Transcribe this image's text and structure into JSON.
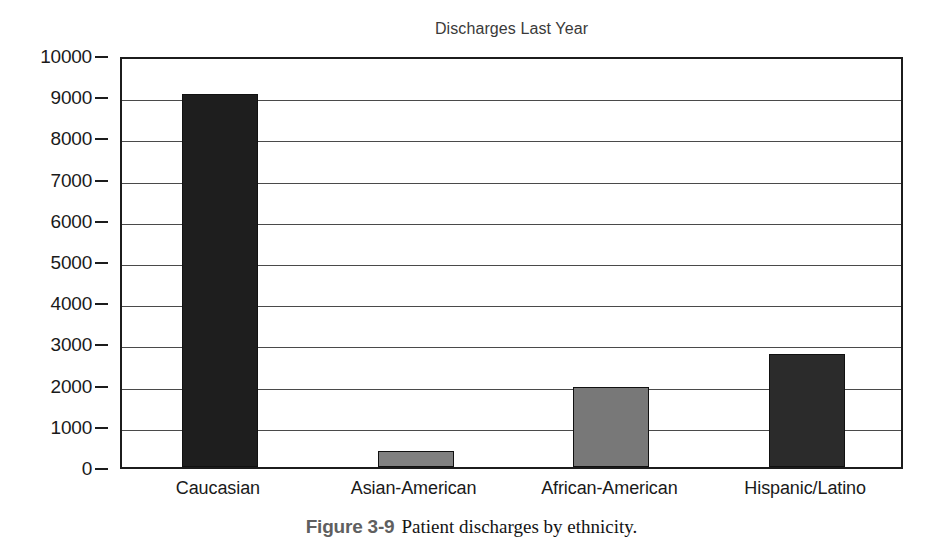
{
  "figure": {
    "caption_number": "Figure 3-9",
    "caption_text": "Patient discharges by ethnicity."
  },
  "chart_data": {
    "type": "bar",
    "title": "Discharges Last Year",
    "xlabel": "",
    "ylabel": "",
    "categories": [
      "Caucasian",
      "Asian-American",
      "African-American",
      "Hispanic/Latino"
    ],
    "values": [
      9050,
      380,
      1940,
      2740
    ],
    "bar_colors": [
      "#1e1e1e",
      "#808080",
      "#787878",
      "#2b2b2b"
    ],
    "ylim": [
      0,
      10000
    ],
    "ytick_labels": [
      "0",
      "1000",
      "2000",
      "3000",
      "4000",
      "5000",
      "6000",
      "7000",
      "8000",
      "9000",
      "10000"
    ],
    "ytick_values": [
      0,
      1000,
      2000,
      3000,
      4000,
      5000,
      6000,
      7000,
      8000,
      9000,
      10000
    ],
    "grid": true,
    "legend": false,
    "legend_position": "none",
    "frame_color": "#1c1c1c",
    "background": "#ffffff"
  }
}
